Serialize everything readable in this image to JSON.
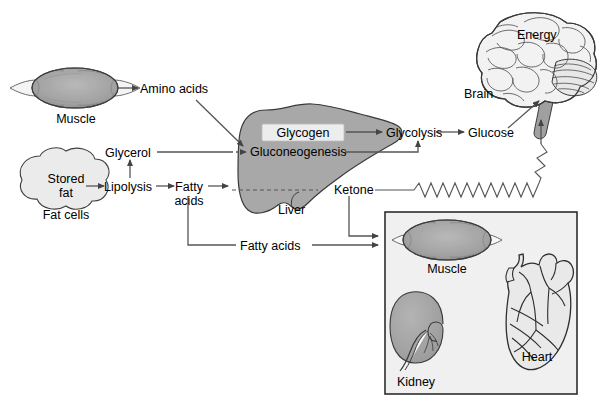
{
  "diagram": {
    "colors": {
      "organ_gray": "#a8a8a8",
      "organ_light": "#e4e4e4",
      "box_fill": "#f0f0f0",
      "stroke": "#3a3a3a",
      "line": "#555555",
      "text": "#000000",
      "glycogen_box_fill": "#ededed"
    },
    "labels": {
      "muscle_top": "Muscle",
      "amino_acids": "Amino acids",
      "stored_fat": "Stored\nfat",
      "stored_fat_line1": "Stored",
      "stored_fat_line2": "fat",
      "fat_cells": "Fat cells",
      "lipolysis": "Lipolysis",
      "glycerol": "Glycerol",
      "fatty_acids_1": "Fatty",
      "fatty_acids_2": "acids",
      "fatty_acids_lower": "Fatty acids",
      "glycogen": "Glycogen",
      "gluconeogenesis": "Gluconeogenesis",
      "liver": "Liver",
      "ketone": "Ketone",
      "glycolysis": "Glycolysis",
      "glucose": "Glucose",
      "energy": "Energy",
      "brain": "Brain",
      "muscle_box": "Muscle",
      "kidney": "Kidney",
      "heart": "Heart"
    },
    "nodes": [
      {
        "id": "muscle-top",
        "label": "Muscle",
        "type": "organ"
      },
      {
        "id": "amino-acids",
        "label": "Amino acids",
        "type": "metabolite"
      },
      {
        "id": "stored-fat",
        "label": "Stored fat",
        "type": "organ"
      },
      {
        "id": "fat-cells",
        "label": "Fat cells",
        "type": "organ-caption"
      },
      {
        "id": "lipolysis",
        "label": "Lipolysis",
        "type": "process"
      },
      {
        "id": "glycerol",
        "label": "Glycerol",
        "type": "metabolite"
      },
      {
        "id": "fatty-acids",
        "label": "Fatty acids",
        "type": "metabolite"
      },
      {
        "id": "glycogen",
        "label": "Glycogen",
        "type": "store"
      },
      {
        "id": "gluconeogenesis",
        "label": "Gluconeogenesis",
        "type": "process"
      },
      {
        "id": "liver",
        "label": "Liver",
        "type": "organ"
      },
      {
        "id": "ketone",
        "label": "Ketone",
        "type": "metabolite"
      },
      {
        "id": "glycolysis",
        "label": "Glycolysis",
        "type": "process"
      },
      {
        "id": "glucose",
        "label": "Glucose",
        "type": "metabolite"
      },
      {
        "id": "brain",
        "label": "Brain",
        "type": "organ"
      },
      {
        "id": "energy",
        "label": "Energy",
        "type": "output"
      },
      {
        "id": "muscle-box",
        "label": "Muscle",
        "type": "organ"
      },
      {
        "id": "kidney",
        "label": "Kidney",
        "type": "organ"
      },
      {
        "id": "heart",
        "label": "Heart",
        "type": "organ"
      }
    ],
    "edges": [
      {
        "from": "muscle-top",
        "to": "amino-acids",
        "style": "solid"
      },
      {
        "from": "amino-acids",
        "to": "gluconeogenesis",
        "style": "solid"
      },
      {
        "from": "stored-fat",
        "to": "lipolysis",
        "style": "solid"
      },
      {
        "from": "lipolysis",
        "to": "glycerol",
        "style": "solid"
      },
      {
        "from": "lipolysis",
        "to": "fatty-acids",
        "style": "solid"
      },
      {
        "from": "glycerol",
        "to": "gluconeogenesis",
        "style": "dashed"
      },
      {
        "from": "fatty-acids",
        "to": "liver",
        "style": "dashed"
      },
      {
        "from": "fatty-acids",
        "to": "fatty-acids-lower",
        "style": "solid"
      },
      {
        "from": "glycogen",
        "to": "glycolysis",
        "style": "solid"
      },
      {
        "from": "gluconeogenesis",
        "to": "glycolysis",
        "style": "solid"
      },
      {
        "from": "glycolysis",
        "to": "glucose",
        "style": "solid"
      },
      {
        "from": "glucose",
        "to": "brain",
        "style": "solid"
      },
      {
        "from": "ketone",
        "to": "brain",
        "style": "zigzag"
      },
      {
        "from": "ketone",
        "to": "organ-box",
        "style": "solid"
      },
      {
        "from": "fatty-acids-lower",
        "to": "organ-box",
        "style": "solid"
      }
    ]
  }
}
